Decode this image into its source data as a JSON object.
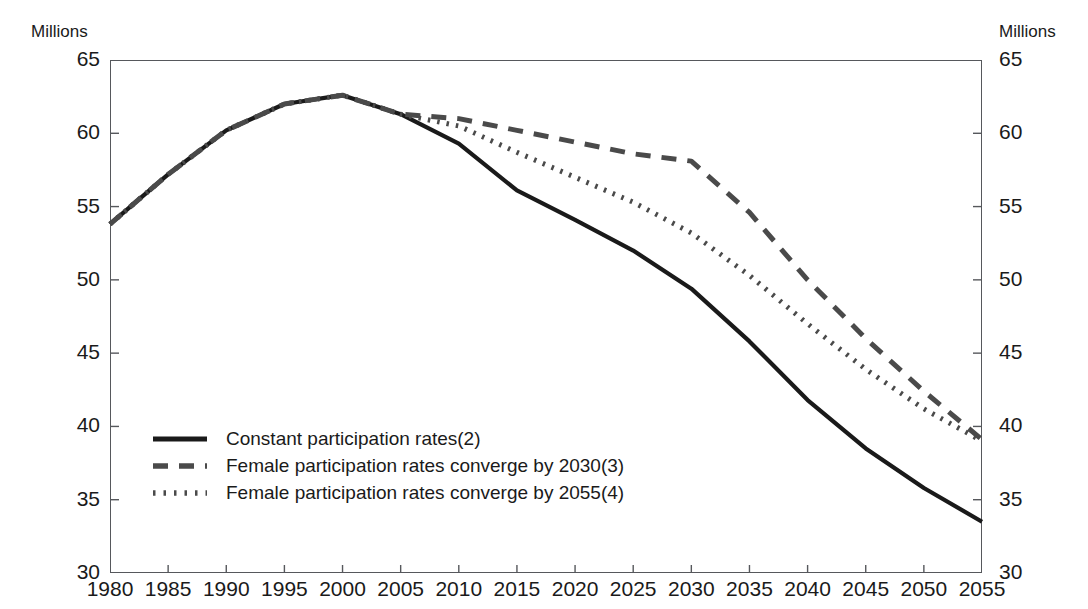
{
  "axis": {
    "unit_left": "Millions",
    "unit_right": "Millions",
    "y_ticks": [
      "65",
      "60",
      "55",
      "50",
      "45",
      "40",
      "35",
      "30"
    ],
    "x_ticks": [
      "1980",
      "1985",
      "1990",
      "1995",
      "2000",
      "2005",
      "2010",
      "2015",
      "2020",
      "2025",
      "2030",
      "2035",
      "2040",
      "2045",
      "2050",
      "2055"
    ]
  },
  "legend": {
    "items": [
      {
        "label": "Constant participation rates(2)",
        "style": "solid",
        "color": "#1a1a1a"
      },
      {
        "label": "Female participation rates converge by 2030(3)",
        "style": "dashed",
        "color": "#4a4a4a"
      },
      {
        "label": "Female participation rates converge by 2055(4)",
        "style": "dotted",
        "color": "#4a4a4a"
      }
    ]
  },
  "chart_data": {
    "type": "line",
    "title": "",
    "subtitle": "",
    "xlabel": "",
    "ylabel": "Millions",
    "ylabel_right": "Millions",
    "xlim": [
      1980,
      2055
    ],
    "ylim": [
      30,
      65
    ],
    "ytick_values": [
      30,
      35,
      40,
      45,
      50,
      55,
      60,
      65
    ],
    "xtick_values": [
      1980,
      1985,
      1990,
      1995,
      2000,
      2005,
      2010,
      2015,
      2020,
      2025,
      2030,
      2035,
      2040,
      2045,
      2050,
      2055
    ],
    "grid": false,
    "legend_position": "lower-left-inside",
    "series": [
      {
        "name": "Constant participation rates(2)",
        "style": "solid",
        "color": "#1a1a1a",
        "x": [
          1980,
          1985,
          1990,
          1995,
          2000,
          2005,
          2010,
          2015,
          2020,
          2025,
          2030,
          2035,
          2040,
          2045,
          2050,
          2055
        ],
        "values": [
          53.8,
          57.2,
          60.2,
          62.0,
          62.6,
          61.3,
          59.3,
          56.1,
          54.1,
          52.0,
          49.4,
          45.8,
          41.8,
          38.5,
          35.8,
          33.5
        ]
      },
      {
        "name": "Female participation rates converge by 2030(3)",
        "style": "dashed",
        "color": "#4a4a4a",
        "x": [
          1980,
          1985,
          1990,
          1995,
          2000,
          2005,
          2010,
          2015,
          2020,
          2025,
          2030,
          2035,
          2040,
          2045,
          2050,
          2055
        ],
        "values": [
          53.8,
          57.2,
          60.2,
          62.0,
          62.6,
          61.3,
          61.0,
          60.2,
          59.4,
          58.6,
          58.1,
          54.6,
          50.0,
          46.0,
          42.4,
          39.1
        ]
      },
      {
        "name": "Female participation rates converge by 2055(4)",
        "style": "dotted",
        "color": "#4a4a4a",
        "x": [
          1980,
          1985,
          1990,
          1995,
          2000,
          2005,
          2010,
          2015,
          2020,
          2025,
          2030,
          2035,
          2040,
          2045,
          2050,
          2055
        ],
        "values": [
          53.8,
          57.2,
          60.2,
          62.0,
          62.6,
          61.3,
          60.5,
          58.7,
          57.0,
          55.3,
          53.2,
          50.3,
          47.0,
          43.9,
          41.2,
          39.0
        ]
      }
    ]
  }
}
